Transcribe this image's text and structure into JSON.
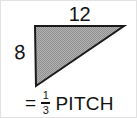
{
  "figure": {
    "shape": "right-triangle"
  },
  "labels": {
    "run": "12",
    "rise": "8"
  },
  "caption": {
    "equals": "=",
    "numerator": "1",
    "denominator": "3",
    "word": "PITCH",
    "full_text": "= 1/3 PITCH"
  },
  "colors": {
    "fill": "#a8a8a8",
    "stroke": "#1a1a1a",
    "text": "#121212",
    "background": "#ffffff",
    "border": "#e2e2e2"
  },
  "geometry": {
    "top_left": [
      34,
      25
    ],
    "top_right": [
      123,
      25
    ],
    "bottom_left": [
      35,
      85
    ]
  }
}
